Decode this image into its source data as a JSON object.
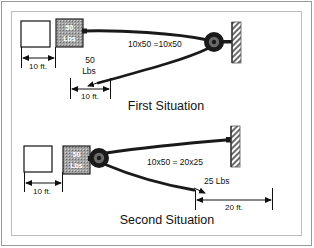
{
  "figure": {
    "border_color": "#8a8a8a",
    "background": "#ffffff",
    "ink_color": "#111111",
    "block_fill": "#9e9e9e",
    "pulley_color": "#1a1a1a"
  },
  "situation_one": {
    "title": "First Situation",
    "weight_block": {
      "line1": "50",
      "line2": "Lbs"
    },
    "equation": "10x50 =10x50",
    "applied_force": {
      "line1": "50",
      "line2": "Lbs"
    },
    "dimension_left": "10 ft.",
    "dimension_right": "10 ft.",
    "icons": {
      "wall": "hatched-wall-icon",
      "pulley": "pulley-icon",
      "box": "empty-box-icon"
    }
  },
  "situation_two": {
    "title": "Second Situation",
    "weight_block": {
      "line1": "50",
      "line2": "Lbs"
    },
    "equation": "10x50 = 20x25",
    "applied_force": "25 Lbs",
    "dimension_left": "10 ft.",
    "dimension_right": "20 ft.",
    "icons": {
      "wall": "hatched-wall-icon",
      "pulley": "pulley-icon",
      "box": "empty-box-icon"
    }
  }
}
